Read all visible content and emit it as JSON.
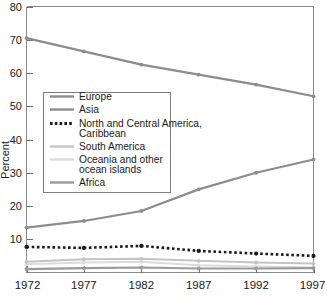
{
  "chart_data": {
    "type": "line",
    "title": "",
    "xlabel": "",
    "ylabel": "Percent",
    "categories": [
      "1972",
      "1977",
      "1982",
      "1987",
      "1992",
      "1997"
    ],
    "x": [
      1972,
      1977,
      1982,
      1987,
      1992,
      1997
    ],
    "xlim": [
      1972,
      1997
    ],
    "ylim": [
      0,
      80
    ],
    "yticks": [
      10,
      20,
      30,
      40,
      50,
      60,
      70,
      80
    ],
    "ytick_labels": [
      "10",
      "20",
      "30",
      "40",
      "50",
      "60",
      "70",
      "80"
    ],
    "grid": false,
    "legend_position": "center-left",
    "series": [
      {
        "name": "Europe",
        "values": [
          70.5,
          66.5,
          62.5,
          59.5,
          56.5,
          53.0
        ],
        "color": "#8c8c8c",
        "style": "solid",
        "width": 2.2,
        "markers": true
      },
      {
        "name": "Asia",
        "values": [
          13.5,
          15.5,
          18.5,
          25.0,
          30.0,
          34.0
        ],
        "color": "#8c8c8c",
        "style": "solid",
        "width": 2.2,
        "markers": true
      },
      {
        "name": "North and Central America, Caribbean",
        "values": [
          7.7,
          7.4,
          8.0,
          6.5,
          5.7,
          5.0
        ],
        "color": "#1a1a1a",
        "style": "dotted",
        "width": 2.6,
        "markers": true
      },
      {
        "name": "South America",
        "values": [
          3.2,
          4.0,
          4.1,
          3.5,
          3.0,
          2.7
        ],
        "color": "#c4c4c4",
        "style": "solid",
        "width": 2.0,
        "markers": true
      },
      {
        "name": "Oceania and other ocean islands",
        "values": [
          2.5,
          3.0,
          3.2,
          2.2,
          1.8,
          1.6
        ],
        "color": "#dcdcdc",
        "style": "solid",
        "width": 2.0,
        "markers": true
      },
      {
        "name": "Africa",
        "values": [
          1.0,
          1.3,
          1.5,
          1.2,
          1.2,
          1.3
        ],
        "color": "#9a9a9a",
        "style": "solid",
        "width": 2.2,
        "markers": true
      }
    ]
  },
  "legend": {
    "entries": [
      {
        "label": "Europe"
      },
      {
        "label": "Asia"
      },
      {
        "label": "North and Central America,"
      },
      {
        "label": "Caribbean"
      },
      {
        "label": "South America"
      },
      {
        "label": "Oceania and other"
      },
      {
        "label": "ocean islands"
      },
      {
        "label": "Africa"
      }
    ]
  },
  "axes": {
    "y_title": "Percent",
    "y_labels": [
      "80",
      "70",
      "60",
      "50",
      "40",
      "30",
      "20",
      "10"
    ],
    "x_labels": [
      "1972",
      "1977",
      "1982",
      "1987",
      "1992",
      "1997"
    ]
  }
}
